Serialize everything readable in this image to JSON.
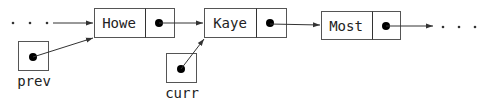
{
  "diagram": {
    "type": "linked-list",
    "nodes": [
      {
        "id": "howe",
        "value": "Howe"
      },
      {
        "id": "kaye",
        "value": "Kaye"
      },
      {
        "id": "most",
        "value": "Most"
      }
    ],
    "pointers": [
      {
        "id": "prev",
        "label": "prev",
        "points_to": "Howe"
      },
      {
        "id": "curr",
        "label": "curr",
        "points_to": "Kaye"
      }
    ],
    "leading_ellipsis": ". . .",
    "trailing_ellipsis": ". . ."
  }
}
